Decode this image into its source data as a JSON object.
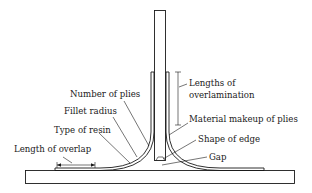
{
  "figure": {
    "type": "T-joint overlamination schematic",
    "labels": {
      "lengths_of_overlamination_line1": "Lengths of",
      "lengths_of_overlamination_line2": "overlamination",
      "number_of_plies": "Number of plies",
      "fillet_radius": "Fillet radius",
      "material_makeup_of_plies": "Material makeup of plies",
      "type_of_resin": "Type of resin",
      "shape_of_edge": "Shape of edge",
      "length_of_overlap": "Length of overlap",
      "gap": "Gap"
    },
    "colors": {
      "line": "#1a1a1a",
      "background": "#ffffff"
    }
  }
}
